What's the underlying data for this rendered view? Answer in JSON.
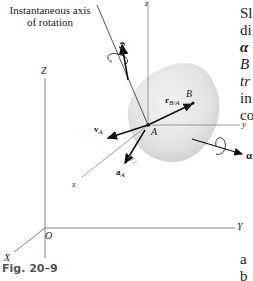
{
  "figure": {
    "caption": "Fig. 20–9",
    "annotation": {
      "line1": "Instantaneous axis",
      "line2": "of rotation"
    },
    "fixed_axes": {
      "X": "X",
      "Y": "Y",
      "Z": "Z",
      "origin": "O"
    },
    "body_axes": {
      "x": "x",
      "y": "y",
      "z": "z"
    },
    "points": {
      "A": "A",
      "B": "B"
    },
    "vectors": {
      "omega": "ω",
      "alpha": "α",
      "v": "v",
      "v_sub": "A",
      "a": "a",
      "a_sub": "A",
      "r": "r",
      "r_sub": "B/A"
    },
    "colors": {
      "body_fill": "#e6e6e6",
      "line": "#333333",
      "axis": "#666666",
      "caption": "#555555"
    }
  },
  "side_text": {
    "lines": [
      "Sl",
      "di",
      "α",
      "B",
      "tr",
      "in",
      "co"
    ],
    "bottom_lines": [
      "a",
      "b"
    ]
  }
}
